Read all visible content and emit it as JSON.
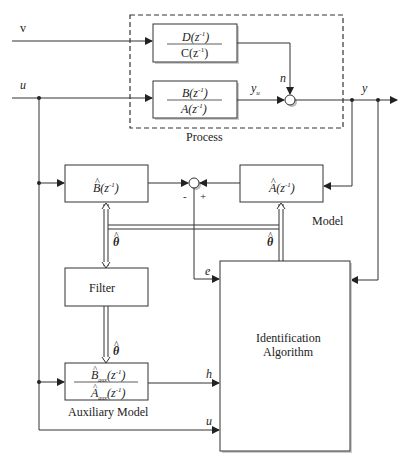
{
  "diagram": {
    "type": "block diagram",
    "signals": {
      "v": "v",
      "u": "u",
      "y": "y",
      "n": "n",
      "yu": "y",
      "yu_sub": "u",
      "e": "e",
      "h": "h",
      "u_in": "u",
      "theta": "θ"
    },
    "process": {
      "label": "Process",
      "noise_block": {
        "num": "D(z",
        "den": "C(z",
        "exp": "-1",
        "close": ")"
      },
      "plant_block": {
        "num": "B(z",
        "den": "A(z",
        "exp": "-1",
        "close": ")"
      }
    },
    "model": {
      "label": "Model",
      "b_block": {
        "text": "B(z",
        "exp": "-1",
        "close": ")"
      },
      "a_block": {
        "text": "A(z",
        "exp": "-1",
        "close": ")"
      },
      "sum_signs": {
        "minus": "-",
        "plus": "+"
      }
    },
    "filter": {
      "label": "Filter"
    },
    "auxiliary_model": {
      "label": "Auxiliary Model",
      "num": "B",
      "den": "A",
      "sub": "aux",
      "arg": "(z",
      "exp": "-1",
      "close": ")"
    },
    "identification": {
      "line1": "Identification",
      "line2": "Algorithm"
    },
    "hat": "^"
  },
  "colors": {
    "line": "#333333",
    "box_border": "#333333",
    "shadow": "#bbbbbb",
    "background": "#ffffff"
  }
}
